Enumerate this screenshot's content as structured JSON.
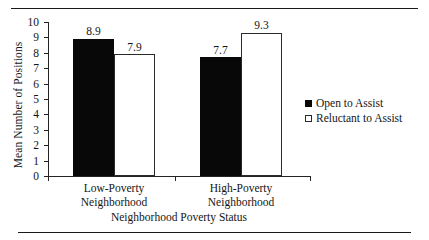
{
  "chart_data": {
    "type": "bar",
    "title": "",
    "subtitle": "",
    "xlabel": "Neighborhood Poverty Status",
    "ylabel": "Mean Number of Positions",
    "categories": [
      "Low-Poverty Neighborhood",
      "High-Poverty Neighborhood"
    ],
    "category_lines": [
      [
        "Low-Poverty",
        "Neighborhood"
      ],
      [
        "High-Poverty",
        "Neighborhood"
      ]
    ],
    "series": [
      {
        "name": "Open to Assist",
        "values": [
          8.9,
          7.7
        ],
        "value_labels": [
          "8.9",
          "7.7"
        ],
        "fill": "#080808",
        "style": "filled"
      },
      {
        "name": "Reluctant to Assist",
        "values": [
          7.9,
          9.3
        ],
        "value_labels": [
          "7.9",
          "9.3"
        ],
        "fill": "#ffffff",
        "style": "hollow"
      }
    ],
    "ylim": [
      0,
      10
    ],
    "yticks": [
      0,
      1,
      2,
      3,
      4,
      5,
      6,
      7,
      8,
      9,
      10
    ],
    "ytick_labels": [
      "0",
      "1",
      "2",
      "3",
      "4",
      "5",
      "6",
      "7",
      "8",
      "9",
      "10"
    ],
    "grid": false,
    "legend_position": "right",
    "legend": [
      "Open to Assist",
      "Reluctant to Assist"
    ]
  }
}
